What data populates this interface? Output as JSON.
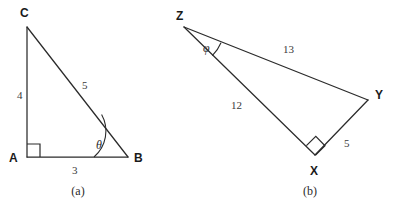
{
  "figure": {
    "background_color": "#ffffff",
    "stroke_color": "#2b2b2b",
    "label_color": "#1a1a1a",
    "width": 396,
    "height": 212
  },
  "panels": [
    {
      "id": "panel-a",
      "caption": "(a)",
      "caption_x": 78,
      "caption_y": 195,
      "triangle": {
        "name": "ABC",
        "type": "right-triangle",
        "vertices": [
          {
            "label": "A",
            "x": 27,
            "y": 157,
            "label_x": 9,
            "label_y": 162
          },
          {
            "label": "B",
            "x": 128,
            "y": 157,
            "label_x": 134,
            "label_y": 162
          },
          {
            "label": "C",
            "x": 27,
            "y": 27,
            "label_x": 20,
            "label_y": 17
          }
        ],
        "sides": [
          {
            "name": "AC",
            "value": "4",
            "label_x": 17,
            "label_y": 99
          },
          {
            "name": "CB",
            "value": "5",
            "label_x": 82,
            "label_y": 89
          },
          {
            "name": "AB",
            "value": "3",
            "label_x": 72,
            "label_y": 174
          }
        ],
        "right_angle": {
          "at": "A",
          "size": 13
        },
        "marked_angle": {
          "symbol": "θ",
          "at": "B",
          "label_x": 96,
          "label_y": 149,
          "radius": 34
        }
      }
    },
    {
      "id": "panel-b",
      "caption": "(b)",
      "caption_x": 310,
      "caption_y": 195,
      "triangle": {
        "name": "XYZ",
        "type": "right-triangle",
        "vertices": [
          {
            "label": "Z",
            "x": 184,
            "y": 27,
            "label_x": 176,
            "label_y": 20
          },
          {
            "label": "Y",
            "x": 368,
            "y": 100,
            "label_x": 375,
            "label_y": 99
          },
          {
            "label": "X",
            "x": 315,
            "y": 155,
            "label_x": 310,
            "label_y": 175
          }
        ],
        "sides": [
          {
            "name": "ZY",
            "value": "13",
            "label_x": 283,
            "label_y": 53
          },
          {
            "name": "ZX",
            "value": "12",
            "label_x": 231,
            "label_y": 109
          },
          {
            "name": "XY",
            "value": "5",
            "label_x": 344,
            "label_y": 147
          }
        ],
        "right_angle": {
          "at": "X",
          "size": 13
        },
        "marked_angle": {
          "symbol": "φ",
          "at": "Z",
          "label_x": 203,
          "label_y": 52,
          "radius": 40
        }
      }
    }
  ]
}
